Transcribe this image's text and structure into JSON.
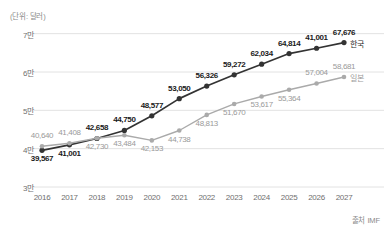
{
  "unit_caption": "(단위: 달러)",
  "source_caption": "출처 IMF",
  "colors": {
    "korea_line": "#333333",
    "japan_line": "#aaaaaa",
    "grid": "#e2e2e2",
    "axis_text": "#6f6f6f",
    "background": "#ffffff"
  },
  "chart_data": {
    "type": "line",
    "title": "",
    "subtitle": "",
    "xlabel": "",
    "ylabel": "(단위: 달러)",
    "grid": true,
    "legend_position": "right-of-last-point",
    "x": [
      "2016",
      "2017",
      "2018",
      "2019",
      "2020",
      "2021",
      "2022",
      "2023",
      "2024",
      "2025",
      "2026",
      "2027"
    ],
    "categories": [
      "2016",
      "2017",
      "2018",
      "2019",
      "2020",
      "2021",
      "2022",
      "2023",
      "2024",
      "2025",
      "2026",
      "2027"
    ],
    "xtick_labels": [
      "2016",
      "2017",
      "2018",
      "2019",
      "2020",
      "2021",
      "2022",
      "2023",
      "2024",
      "2025",
      "2026",
      "2027"
    ],
    "ytick_labels": [
      "7만",
      "6만",
      "5만",
      "4만",
      "3만"
    ],
    "ytick_values": [
      70000,
      60000,
      50000,
      40000,
      30000
    ],
    "ylim": [
      30000,
      72000
    ],
    "series": [
      {
        "name": "한국",
        "color": "#333333",
        "values": [
          39567,
          41001,
          42658,
          44750,
          48577,
          53050,
          56326,
          59272,
          62034,
          64814,
          41001,
          67676
        ],
        "point_labels": [
          "39,567",
          "41,001",
          "42,658",
          "44,750",
          "48,577",
          "53,050",
          "56,326",
          "59,272",
          "62,034",
          "64,814",
          "41,001",
          "67,676"
        ],
        "label_positions": [
          "below",
          "below",
          "above",
          "above",
          "above",
          "above",
          "above",
          "above",
          "above",
          "above",
          "above",
          "above"
        ]
      },
      {
        "name": "일본",
        "color": "#aaaaaa",
        "values": [
          40640,
          41408,
          42730,
          43484,
          42153,
          44738,
          48813,
          51670,
          53617,
          55364,
          57004,
          58681
        ],
        "point_labels": [
          "40,640",
          "41,408",
          "42,730",
          "43,484",
          "42,153",
          "44,738",
          "48,813",
          "51,670",
          "53,617",
          "55,364",
          "57,004",
          "58,681"
        ],
        "label_positions": [
          "above",
          "above",
          "below",
          "below",
          "below",
          "below",
          "below",
          "below",
          "below",
          "below",
          "above",
          "above"
        ]
      }
    ]
  }
}
